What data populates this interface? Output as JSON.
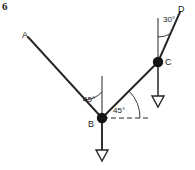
{
  "figure": {
    "number": "6",
    "type": "force-vector-diagram",
    "stroke_color": "#262626",
    "background_color": "#ffffff",
    "points": [
      {
        "id": "A",
        "label": "A",
        "x": 28,
        "y": 37,
        "node": false
      },
      {
        "id": "B",
        "label": "B",
        "x": 102,
        "y": 118,
        "node": true
      },
      {
        "id": "C",
        "label": "C",
        "x": 158,
        "y": 62,
        "node": true
      },
      {
        "id": "D",
        "label": "D",
        "x": 180,
        "y": 12,
        "node": false
      }
    ],
    "segments": [
      {
        "id": "AB",
        "from": "A",
        "to": "B",
        "style": "solid"
      },
      {
        "id": "BC",
        "from": "B",
        "to": "C",
        "style": "solid"
      },
      {
        "id": "CD",
        "from": "C",
        "to": "D",
        "style": "solid"
      }
    ],
    "reference_lines": [
      {
        "id": "vertical-at-B",
        "x1": 102,
        "y1": 76,
        "x2": 102,
        "y2": 118,
        "style": "solid"
      },
      {
        "id": "horizontal-at-B",
        "x1": 102,
        "y1": 118,
        "x2": 148,
        "y2": 118,
        "style": "dashed"
      },
      {
        "id": "vertical-at-C",
        "x1": 158,
        "y1": 18,
        "x2": 158,
        "y2": 62,
        "style": "solid"
      }
    ],
    "load_arrows": [
      {
        "id": "load-at-B",
        "x1": 102,
        "y1": 118,
        "x2": 102,
        "y2": 158,
        "head": "open-triangle"
      },
      {
        "id": "load-at-C",
        "x1": 158,
        "y1": 62,
        "x2": 158,
        "y2": 104,
        "head": "open-triangle"
      }
    ],
    "angles": [
      {
        "id": "angle-B-left",
        "value": "45",
        "label": "45°",
        "at": "B",
        "between": [
          "vertical-at-B",
          "AB"
        ]
      },
      {
        "id": "angle-B-right",
        "value": "45",
        "label": "45°",
        "at": "B",
        "between": [
          "horizontal-at-B",
          "BC"
        ]
      },
      {
        "id": "angle-C",
        "value": "30",
        "label": "30°",
        "at": "C",
        "between": [
          "vertical-at-C",
          "CD"
        ]
      }
    ]
  }
}
